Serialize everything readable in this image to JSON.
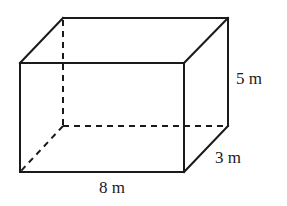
{
  "diagram": {
    "type": "rectangular-prism",
    "dimensions": {
      "length": {
        "label": "8 m",
        "value": 8,
        "unit": "m"
      },
      "width": {
        "label": "3 m",
        "value": 3,
        "unit": "m"
      },
      "height": {
        "label": "5 m",
        "value": 5,
        "unit": "m"
      }
    },
    "colors": {
      "stroke": "#1a1a1a",
      "background": "#ffffff"
    }
  }
}
